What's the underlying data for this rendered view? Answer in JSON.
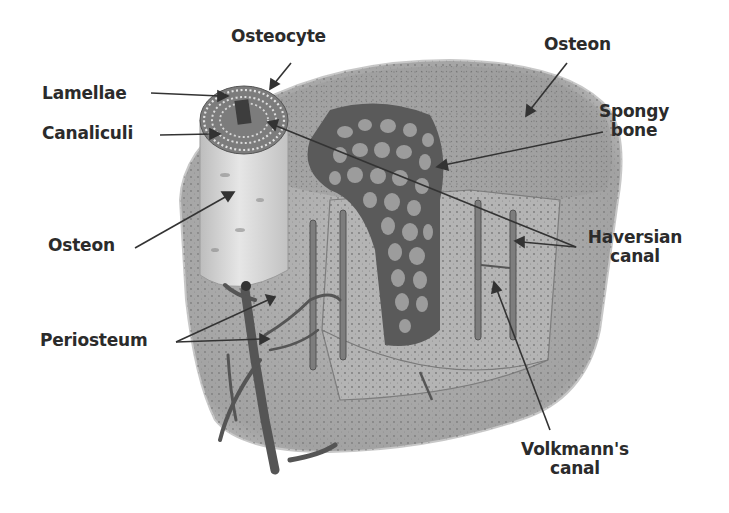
{
  "diagram": {
    "colors": {
      "background": "#ffffff",
      "bone_outer": "#a9a9a9",
      "bone_top": "#9e9e9e",
      "bone_dark": "#6f6f6f",
      "osteon_column": "#d9d9d9",
      "spongy_dark": "#4a4a4a",
      "vessel": "#5a5a5a",
      "label_text": "#2b2b2b",
      "leader_line": "#333333"
    },
    "labels": [
      {
        "id": "osteocyte",
        "text": "Osteocyte",
        "x": 231,
        "y": 35,
        "align": "left",
        "points_to": [
          [
            291,
            63
          ],
          [
            272,
            86
          ]
        ]
      },
      {
        "id": "lamellae",
        "text": "Lamellae",
        "x": 42,
        "y": 84,
        "align": "left",
        "points_to": [
          [
            151,
            93
          ],
          [
            226,
            96
          ]
        ]
      },
      {
        "id": "canaliculi",
        "text": "Canaliculi",
        "x": 42,
        "y": 124,
        "align": "left",
        "points_to": [
          [
            160,
            135
          ],
          [
            220,
            134
          ]
        ]
      },
      {
        "id": "osteon-left",
        "text": "Osteon",
        "x": 48,
        "y": 233,
        "align": "left",
        "points_to": [
          [
            135,
            248
          ],
          [
            233,
            192
          ]
        ]
      },
      {
        "id": "osteon-right",
        "text": "Osteon",
        "x": 544,
        "y": 35,
        "align": "left",
        "points_to": [
          [
            567,
            63
          ],
          [
            527,
            115
          ]
        ]
      },
      {
        "id": "spongy-bone",
        "text": "Spongy\nbone",
        "x": 610,
        "y": 103,
        "align": "center",
        "points_to": [
          [
            603,
            132
          ],
          [
            437,
            167
          ]
        ]
      },
      {
        "id": "haversian-canal",
        "text": "Haversian\ncanal",
        "x": 592,
        "y": 228,
        "align": "center",
        "points_to": [
          [
            576,
            247
          ],
          [
            516,
            242
          ],
          [
            268,
            122
          ]
        ]
      },
      {
        "id": "periosteum",
        "text": "Periosteum",
        "x": 40,
        "y": 327,
        "align": "left",
        "points_to": [
          [
            176,
            342
          ],
          [
            275,
            297
          ],
          [
            268,
            339
          ]
        ]
      },
      {
        "id": "volkmanns-canal",
        "text": "Volkmann's\ncanal",
        "x": 522,
        "y": 440,
        "align": "center",
        "points_to": [
          [
            550,
            430
          ],
          [
            494,
            282
          ]
        ]
      }
    ]
  }
}
